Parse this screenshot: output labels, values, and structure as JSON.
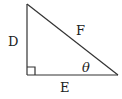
{
  "diagram": {
    "type": "right-triangle",
    "labels": {
      "vertical_leg": "D",
      "horizontal_leg": "E",
      "hypotenuse": "F",
      "angle": "θ"
    },
    "right_angle_marker": true,
    "stroke_color": "#333333"
  }
}
